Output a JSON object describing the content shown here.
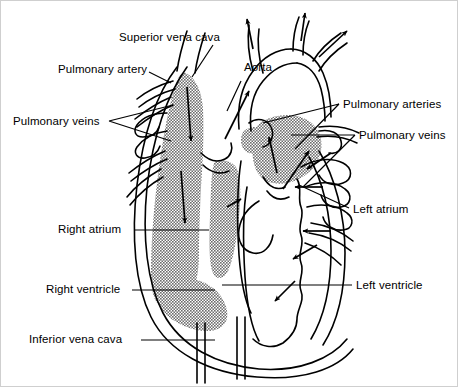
{
  "figure": {
    "type": "anatomical-diagram",
    "background_color": "#ffffff",
    "line_color": "#000000",
    "shaded_color": "#9a9a9a",
    "shaded_meaning": "deoxygenated blood (right heart chambers)",
    "unshaded_meaning": "oxygenated blood (left heart chambers)"
  },
  "labels": [
    {
      "id": "superior-vena-cava",
      "text": "Superior vena cava",
      "x": 118,
      "y": 30,
      "leader": "M 212,44 L 191,76"
    },
    {
      "id": "pulmonary-artery",
      "text": "Pulmonary artery",
      "x": 57,
      "y": 62,
      "leader": "M 148,71 L 170,80"
    },
    {
      "id": "aorta",
      "text": "Aorta",
      "x": 243,
      "y": 60,
      "leader": "M 240,80 L 214,128"
    },
    {
      "id": "pulmonary-veins-left",
      "text": "Pulmonary veins",
      "x": 12,
      "y": 114,
      "leader": "M 108,120 L 172,104 M 108,120 L 172,140"
    },
    {
      "id": "pulmonary-arteries-right",
      "text": "Pulmonary arteries",
      "x": 342,
      "y": 97,
      "leader": "M 338,103 L 262,122 M 338,103 L 292,146"
    },
    {
      "id": "pulmonary-veins-right",
      "text": "Pulmonary veins",
      "x": 358,
      "y": 128,
      "leader": "M 354,134 L 288,134 M 354,134 L 300,184"
    },
    {
      "id": "right-atrium",
      "text": "Right atrium",
      "x": 57,
      "y": 222,
      "leader": "M 133,229 L 208,229"
    },
    {
      "id": "left-atrium",
      "text": "Left atrium",
      "x": 352,
      "y": 202,
      "leader": "M 348,207 L 298,186"
    },
    {
      "id": "right-ventricle",
      "text": "Right ventricle",
      "x": 45,
      "y": 282,
      "leader": "M 131,289 L 213,289"
    },
    {
      "id": "left-ventricle",
      "text": "Left ventricle",
      "x": 355,
      "y": 278,
      "leader": "M 351,284 L 221,284"
    },
    {
      "id": "inferior-vena-cava",
      "text": "Inferior vena cava",
      "x": 28,
      "y": 332,
      "leader": "M 140,339 L 214,339"
    }
  ],
  "flow_arrows": [
    {
      "id": "svc-inflow-upper",
      "direction": "down",
      "region": "superior vena cava into right atrium"
    },
    {
      "id": "svc-inflow-lower",
      "direction": "down",
      "region": "right atrium descending"
    },
    {
      "id": "aorta-outflow",
      "direction": "up-right",
      "region": "ascending aorta"
    },
    {
      "id": "aortic-arch-branch-1",
      "direction": "up",
      "region": "brachiocephalic trunk"
    },
    {
      "id": "aortic-arch-branch-2",
      "direction": "up",
      "region": "left common carotid"
    },
    {
      "id": "aortic-arch-branch-3",
      "direction": "up-right",
      "region": "left subclavian"
    },
    {
      "id": "pulmonary-trunk-outflow",
      "direction": "up",
      "region": "right ventricle to pulmonary trunk"
    },
    {
      "id": "right-ventricle-flow",
      "direction": "up-right",
      "region": "right ventricle"
    },
    {
      "id": "pulmonary-vein-return-1",
      "direction": "left-down",
      "region": "upper pulmonary vein into left atrium"
    },
    {
      "id": "pulmonary-vein-return-2",
      "direction": "left",
      "region": "middle pulmonary vein into left atrium"
    },
    {
      "id": "pulmonary-vein-return-3",
      "direction": "left",
      "region": "lower pulmonary vein into left atrium"
    },
    {
      "id": "left-atrium-to-ventricle",
      "direction": "left-down",
      "region": "mitral valve flow"
    },
    {
      "id": "pulmonary-artery-out",
      "direction": "right-down",
      "region": "right pulmonary artery"
    }
  ]
}
